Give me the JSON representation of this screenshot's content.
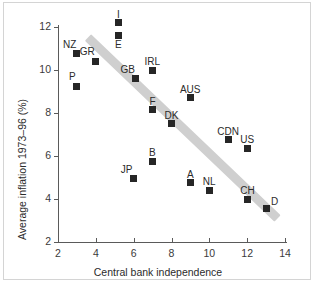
{
  "chart_data": {
    "type": "scatter",
    "title": "",
    "xlabel": "Central bank independence",
    "ylabel": "Average inflation 1973–96 (%)",
    "xlim": [
      2,
      14
    ],
    "ylim": [
      2,
      12
    ],
    "xticks": [
      "2",
      "4",
      "6",
      "8",
      "10",
      "12",
      "14"
    ],
    "yticks": [
      "2",
      "4",
      "6",
      "8",
      "10",
      "12"
    ],
    "grid": false,
    "legend": "none",
    "trendline": {
      "kind": "shaded-band",
      "color": "#cfcfcf",
      "x_start": 3.6,
      "y_start": 11.5,
      "x_end": 13.6,
      "y_end": 3.1
    },
    "points": [
      {
        "label": "NZ",
        "x": 3.0,
        "y": 10.75,
        "label_pos": "above-left"
      },
      {
        "label": "P",
        "x": 3.0,
        "y": 9.25,
        "label_pos": "above-left"
      },
      {
        "label": "GR",
        "x": 4.0,
        "y": 10.4,
        "label_pos": "above-left"
      },
      {
        "label": "I",
        "x": 5.2,
        "y": 12.2,
        "label_pos": "above"
      },
      {
        "label": "E",
        "x": 5.2,
        "y": 11.6,
        "label_pos": "below"
      },
      {
        "label": "GB",
        "x": 6.1,
        "y": 9.6,
        "label_pos": "above-left"
      },
      {
        "label": "IRL",
        "x": 7.0,
        "y": 10.0,
        "label_pos": "above"
      },
      {
        "label": "JP",
        "x": 6.0,
        "y": 4.95,
        "label_pos": "above-left"
      },
      {
        "label": "B",
        "x": 7.0,
        "y": 5.75,
        "label_pos": "above"
      },
      {
        "label": "F",
        "x": 7.0,
        "y": 8.15,
        "label_pos": "above"
      },
      {
        "label": "DK",
        "x": 8.0,
        "y": 7.5,
        "label_pos": "above"
      },
      {
        "label": "AUS",
        "x": 9.0,
        "y": 8.7,
        "label_pos": "above"
      },
      {
        "label": "A",
        "x": 9.0,
        "y": 4.75,
        "label_pos": "above"
      },
      {
        "label": "NL",
        "x": 10.0,
        "y": 4.4,
        "label_pos": "above"
      },
      {
        "label": "CDN",
        "x": 11.0,
        "y": 6.75,
        "label_pos": "above"
      },
      {
        "label": "US",
        "x": 12.0,
        "y": 6.35,
        "label_pos": "above"
      },
      {
        "label": "CH",
        "x": 12.0,
        "y": 4.0,
        "label_pos": "above"
      },
      {
        "label": "D",
        "x": 13.0,
        "y": 3.55,
        "label_pos": "above-right"
      }
    ]
  }
}
